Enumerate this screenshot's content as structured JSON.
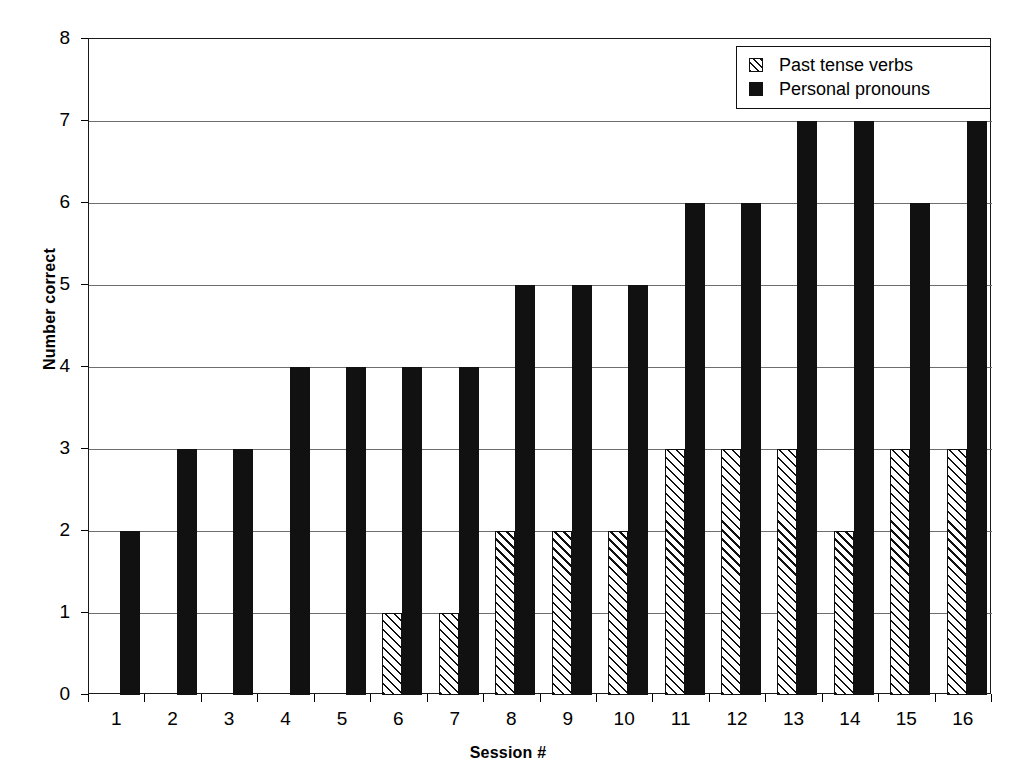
{
  "chart_data": {
    "type": "bar",
    "title": "",
    "xlabel": "Session #",
    "ylabel": "Number correct",
    "categories": [
      "1",
      "2",
      "3",
      "4",
      "5",
      "6",
      "7",
      "8",
      "9",
      "10",
      "11",
      "12",
      "13",
      "14",
      "15",
      "16"
    ],
    "series": [
      {
        "name": "Past tense verbs",
        "pattern": "diagonal-hatch",
        "color": "#ffffff",
        "edge_color": "#111111",
        "values": [
          0,
          0,
          0,
          0,
          0,
          1,
          1,
          2,
          2,
          2,
          3,
          3,
          3,
          2,
          3,
          3
        ]
      },
      {
        "name": "Personal pronouns",
        "pattern": "solid",
        "color": "#111111",
        "edge_color": "#111111",
        "values": [
          2,
          3,
          3,
          4,
          4,
          4,
          4,
          5,
          5,
          5,
          6,
          6,
          7,
          7,
          6,
          7
        ]
      }
    ],
    "ylim": [
      0,
      8
    ],
    "ytick_labels": [
      "0",
      "1",
      "2",
      "3",
      "4",
      "5",
      "6",
      "7",
      "8"
    ],
    "grid": "horizontal",
    "legend_position": "top-right"
  },
  "legend": {
    "items": [
      {
        "label": "Past tense verbs"
      },
      {
        "label": "Personal pronouns"
      }
    ]
  },
  "axes": {
    "y_title": "Number correct",
    "x_title": "Session #"
  }
}
